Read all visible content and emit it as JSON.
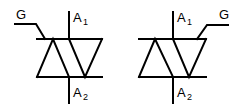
{
  "diagram": {
    "symbols": [
      {
        "id": "triac-gate-left",
        "labels": {
          "gate": "G",
          "anode1_main": "A",
          "anode1_sub": "1",
          "anode2_main": "A",
          "anode2_sub": "2"
        }
      },
      {
        "id": "triac-gate-right",
        "labels": {
          "gate": "G",
          "anode1_main": "A",
          "anode1_sub": "1",
          "anode2_main": "A",
          "anode2_sub": "2"
        }
      }
    ],
    "colors": {
      "stroke": "#000000",
      "background": "#ffffff"
    }
  }
}
